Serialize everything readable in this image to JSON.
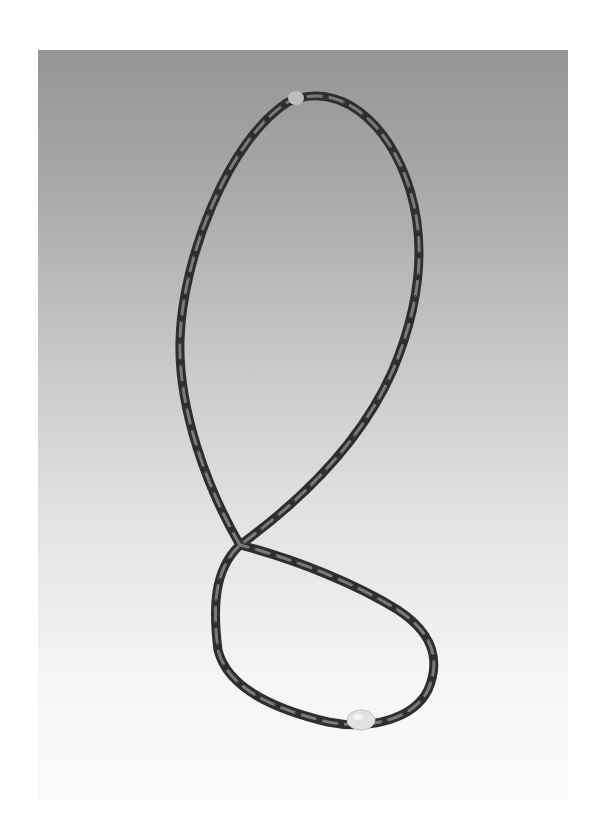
{
  "image": {
    "subject": "Beaded necklace laid in a figure-eight shape on a gray-to-white gradient backdrop",
    "colors": {
      "page_background": "#ffffff",
      "backdrop_top": "#959595",
      "backdrop_bottom": "#fbfbfb",
      "bead_dark": "#3a3a3a",
      "bead_highlight": "#8a8a8a",
      "accent_bead_top": "#cfcfcf",
      "accent_bead_bottom": "#e6e6e6"
    },
    "elements": {
      "necklace": "strand of elongated rice-shaped dark beads",
      "top_accent_bead": "small pale round bead at top of upper loop",
      "bottom_accent_bead": "large pale barrel bead at bottom of lower loop",
      "crossing": "strand crosses itself forming a figure-eight"
    }
  }
}
